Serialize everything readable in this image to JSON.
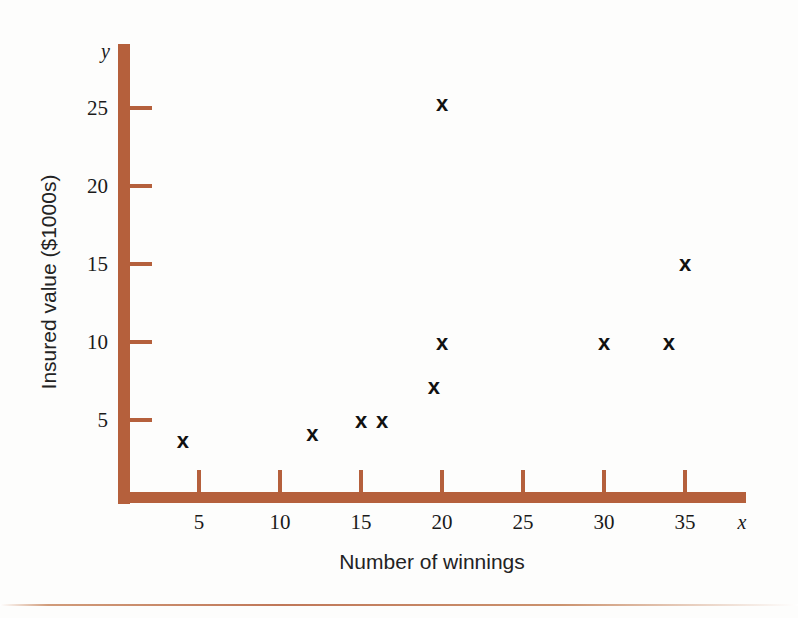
{
  "figure": {
    "background_color": "#fdfdfc",
    "axis_color": "#b5603c",
    "marker_color": "#111111",
    "y_axis_var": "y",
    "x_axis_var": "x"
  },
  "chart_data": {
    "type": "scatter",
    "title": "",
    "xlabel": "Number of winnings",
    "ylabel": "Insured value ($1000s)",
    "xlim": [
      0,
      38
    ],
    "ylim": [
      0,
      27
    ],
    "xticks": [
      5,
      10,
      15,
      20,
      25,
      30,
      35
    ],
    "ytick_labels": [
      "5",
      "10",
      "15",
      "20",
      "25"
    ],
    "xtick_labels": [
      "5",
      "10",
      "15",
      "20",
      "25",
      "30",
      "35"
    ],
    "yticks": [
      5,
      10,
      15,
      20,
      25
    ],
    "grid": false,
    "legend": false,
    "marker": "x",
    "points": [
      {
        "x": 4,
        "y": 3.7
      },
      {
        "x": 12,
        "y": 4.2
      },
      {
        "x": 15,
        "y": 5.0
      },
      {
        "x": 16.3,
        "y": 5.0
      },
      {
        "x": 19.5,
        "y": 7.2
      },
      {
        "x": 20,
        "y": 10.0
      },
      {
        "x": 20,
        "y": 25.2
      },
      {
        "x": 30,
        "y": 10.0
      },
      {
        "x": 34,
        "y": 10.0
      },
      {
        "x": 35,
        "y": 15.0
      }
    ]
  }
}
